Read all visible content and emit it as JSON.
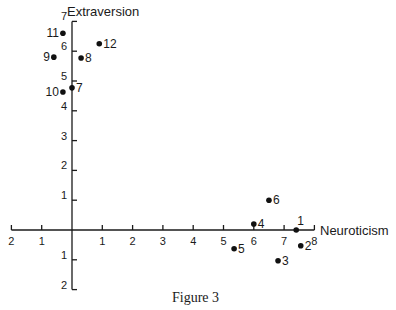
{
  "caption": "Figure 3",
  "chart_data": {
    "type": "scatter",
    "title": "",
    "caption": "Figure 3",
    "xlabel": "Neuroticism",
    "ylabel": "Extraversion",
    "xlim": [
      -2,
      8
    ],
    "ylim": [
      -2,
      7
    ],
    "x_tick_labels": [
      "2",
      "1",
      "",
      "1",
      "2",
      "3",
      "4",
      "5",
      "6",
      "7",
      "8"
    ],
    "x_ticks": [
      -2,
      -1,
      0,
      1,
      2,
      3,
      4,
      5,
      6,
      7,
      8
    ],
    "y_tick_labels": [
      "2",
      "1",
      "",
      "1",
      "2",
      "3",
      "4",
      "5",
      "6",
      "7"
    ],
    "y_ticks": [
      -2,
      -1,
      0,
      1,
      2,
      3,
      4,
      5,
      6,
      7
    ],
    "grid": false,
    "legend": null,
    "points": [
      {
        "label": "1",
        "x": 7.4,
        "y": 0.0
      },
      {
        "label": "2",
        "x": 7.55,
        "y": -0.53
      },
      {
        "label": "3",
        "x": 6.8,
        "y": -1.03
      },
      {
        "label": "4",
        "x": 6.0,
        "y": 0.2
      },
      {
        "label": "5",
        "x": 5.35,
        "y": -0.63
      },
      {
        "label": "6",
        "x": 6.5,
        "y": 1.0
      },
      {
        "label": "7",
        "x": 0.0,
        "y": 4.77
      },
      {
        "label": "8",
        "x": 0.3,
        "y": 5.77
      },
      {
        "label": "9",
        "x": -0.6,
        "y": 5.8
      },
      {
        "label": "10",
        "x": -0.3,
        "y": 4.63
      },
      {
        "label": "11",
        "x": -0.3,
        "y": 6.6
      },
      {
        "label": "12",
        "x": 0.9,
        "y": 6.25
      }
    ],
    "label_placement": {
      "1": "above-right",
      "2": "right",
      "3": "right",
      "4": "right",
      "5": "right",
      "6": "right",
      "7": "right",
      "8": "right",
      "9": "left",
      "10": "left",
      "11": "left",
      "12": "right"
    }
  }
}
